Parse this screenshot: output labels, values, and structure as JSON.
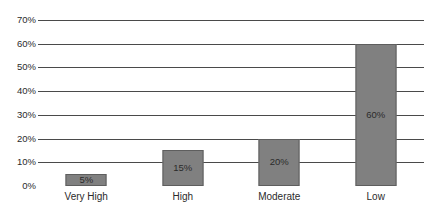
{
  "chart_data": {
    "type": "bar",
    "title": "",
    "subtitle": "",
    "xlabel": "",
    "ylabel": "",
    "categories": [
      "Very High",
      "High",
      "Moderate",
      "Low"
    ],
    "values": [
      5,
      15,
      20,
      60
    ],
    "value_labels": [
      "5%",
      "15%",
      "20%",
      "60%"
    ],
    "ylim": [
      0,
      70
    ],
    "ytick_values": [
      0,
      10,
      20,
      30,
      40,
      50,
      60,
      70
    ],
    "ytick_labels": [
      "0%",
      "10%",
      "20%",
      "30%",
      "40%",
      "50%",
      "60%",
      "70%"
    ],
    "grid": true,
    "grid_axis": "y",
    "legend": false,
    "legend_position": "none",
    "orientation": "vertical",
    "series": [
      {
        "name": "",
        "values": [
          5,
          15,
          20,
          60
        ]
      }
    ],
    "colors": {
      "bar_fill": "#808080",
      "bar_border": "#5e5e5e",
      "gridline": "#4a4a4a",
      "background": "#ffffff",
      "text": "#2b2b2b"
    }
  }
}
